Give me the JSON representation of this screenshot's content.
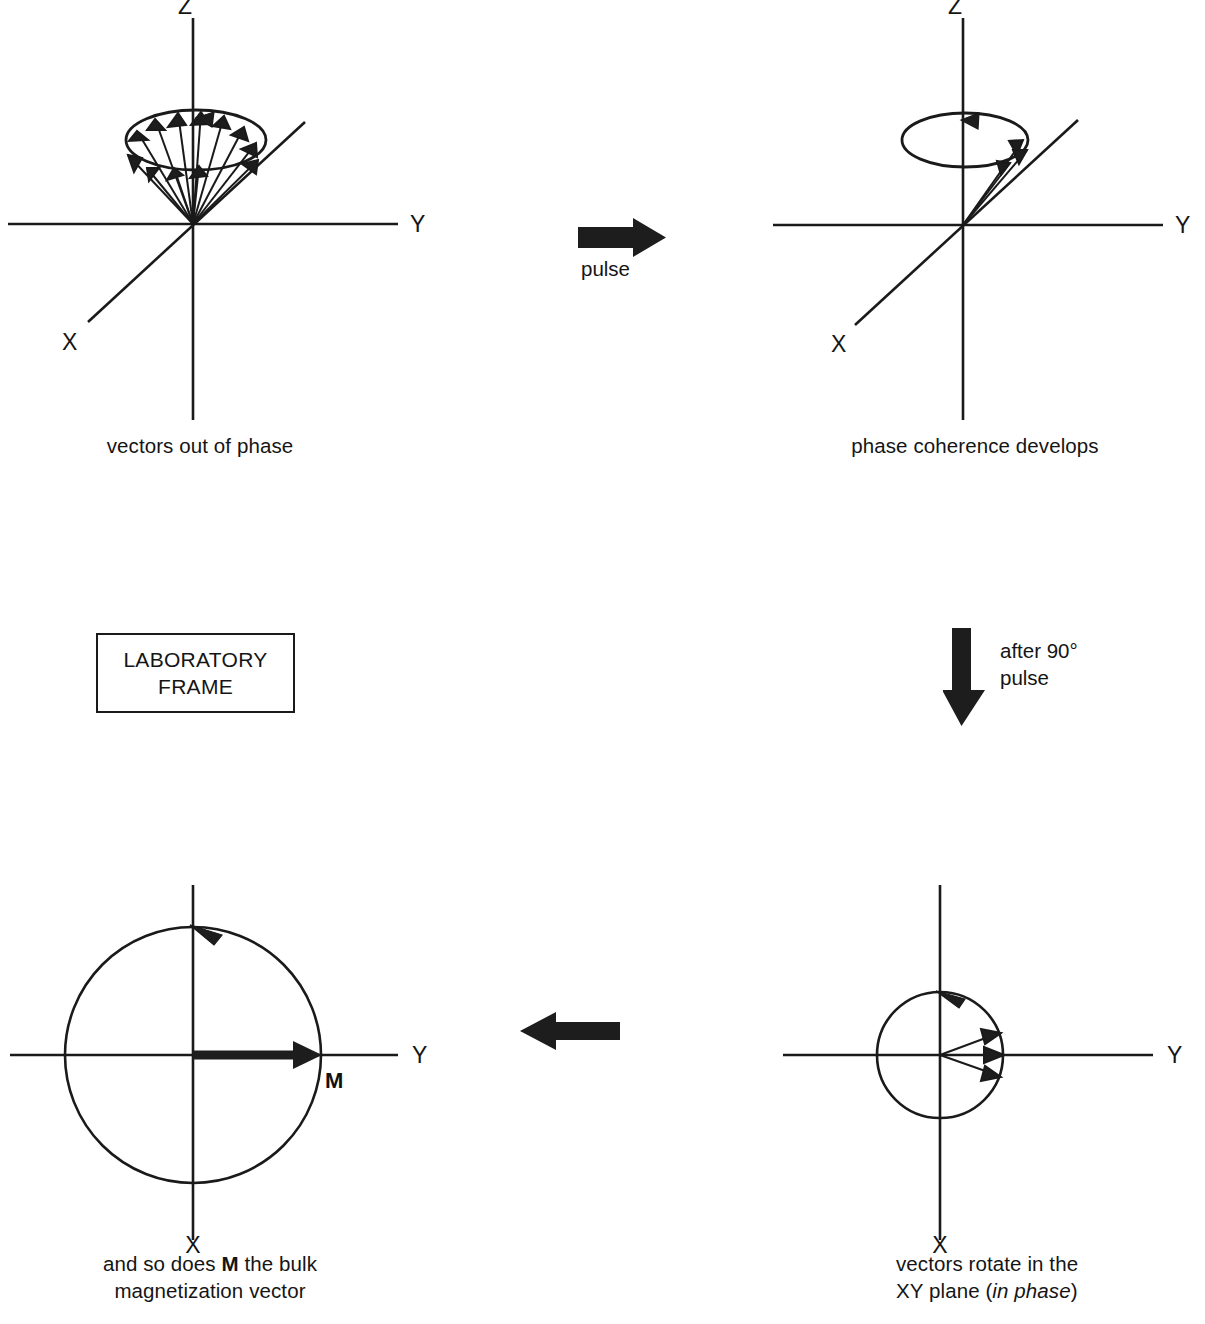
{
  "figure": {
    "frame_box_label": "LABORATORY\nFRAME",
    "stroke_color": "#1a1a1a",
    "arrow_fill": "#1d1d1d",
    "background": "#ffffff"
  },
  "panels": {
    "top_left": {
      "caption": "vectors out of phase",
      "axes": {
        "z": "Z",
        "y": "Y",
        "x": "X"
      },
      "description": "cone of spin vectors precessing about Z, randomly distributed in phase",
      "vector_count": 12
    },
    "top_right": {
      "caption": "phase coherence develops",
      "axes": {
        "z": "Z",
        "y": "Y",
        "x": "X"
      },
      "description": "spin vectors bunched together on the precession cone",
      "vector_count": 3
    },
    "bottom_right": {
      "caption": "vectors rotate in the\nXY plane (in phase)",
      "caption_line1": "vectors rotate in the",
      "caption_line2_pre": "XY plane (",
      "caption_line2_italic": "in phase",
      "caption_line2_post": ")",
      "axes": {
        "y": "Y",
        "x": "X"
      },
      "description": "three coherent vectors in the XY plane near the +Y axis",
      "vector_count": 3
    },
    "bottom_left": {
      "caption": "and so does M the bulk\nmagnetization vector",
      "caption_line1_pre": "and so does ",
      "caption_line1_bold": "M",
      "caption_line1_post": " the bulk",
      "caption_line2": "magnetization vector",
      "axes": {
        "y": "Y",
        "x": "X"
      },
      "vector_label": "M",
      "description": "single bulk magnetization vector M along +Y rotating in the XY plane"
    }
  },
  "transitions": {
    "pulse_right": {
      "label": "pulse",
      "direction": "right"
    },
    "after_90_down": {
      "label": "after 90°\npulse",
      "direction": "down"
    },
    "left_return": {
      "label": "",
      "direction": "left"
    }
  }
}
